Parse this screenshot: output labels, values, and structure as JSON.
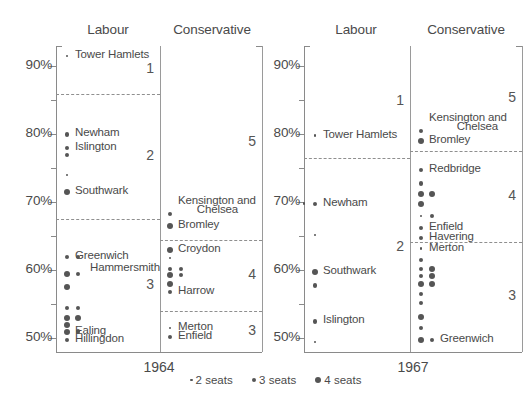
{
  "figure": {
    "panels": [
      {
        "year": "1964",
        "columns": [
          "Labour",
          "Conservative"
        ]
      },
      {
        "year": "1967",
        "columns": [
          "Labour",
          "Conservative"
        ]
      }
    ],
    "y_axis": {
      "ticks": [
        "90%",
        "80%",
        "70%",
        "60%",
        "50%"
      ],
      "minor_step": 5,
      "range": [
        48,
        93
      ]
    },
    "legend": [
      {
        "label": "2 seats",
        "size": "s2"
      },
      {
        "label": "3 seats",
        "size": "s3"
      },
      {
        "label": "4 seats",
        "size": "s4"
      }
    ]
  },
  "chart_data": {
    "type": "scatter",
    "title": "",
    "xlabel": "",
    "ylabel": "",
    "ylim": [
      48,
      93
    ],
    "y_ticks": [
      50,
      60,
      70,
      80,
      90
    ],
    "y_tick_labels": [
      "50%",
      "60%",
      "70%",
      "80%",
      "90%"
    ],
    "grid": false,
    "legend_position": "bottom",
    "size_encoding": {
      "2 seats": 2.6,
      "3 seats": 4.4,
      "4 seats": 6.2
    },
    "panels": [
      {
        "year": "1964",
        "column": "Labour",
        "bands": [
          {
            "number": "1",
            "top": 93,
            "bottom": 86
          },
          {
            "number": "2",
            "top": 86,
            "bottom": 67.5
          },
          {
            "number": "3",
            "top": 67.5,
            "bottom": 48
          }
        ],
        "points": [
          {
            "value": 91.5,
            "seats": 2,
            "label": "Tower Hamlets",
            "label_side": "right"
          },
          {
            "value": 80.0,
            "seats": 3,
            "label": "Newham",
            "label_side": "right"
          },
          {
            "value": 78.0,
            "seats": 3,
            "label": "Islington",
            "label_side": "right"
          },
          {
            "value": 77.0,
            "seats": 3,
            "label": "",
            "label_side": "right"
          },
          {
            "value": 74.0,
            "seats": 2,
            "label": "",
            "label_side": "right"
          },
          {
            "value": 71.5,
            "seats": 4,
            "label": "Southwark",
            "label_side": "right"
          },
          {
            "value": 62.0,
            "seats": 3,
            "label": "Greenwich",
            "label_side": "right"
          },
          {
            "value": 62.0,
            "seats": 3,
            "label": "Hammersmith",
            "label_side": "right",
            "offset": 1
          },
          {
            "value": 59.5,
            "seats": 4,
            "label": "",
            "label_side": "right"
          },
          {
            "value": 59.5,
            "seats": 3,
            "label": "",
            "label_side": "right",
            "offset": 1
          },
          {
            "value": 57.5,
            "seats": 4,
            "label": "",
            "label_side": "right"
          },
          {
            "value": 54.5,
            "seats": 3,
            "label": "",
            "label_side": "right"
          },
          {
            "value": 54.5,
            "seats": 3,
            "label": "",
            "label_side": "right",
            "offset": 1
          },
          {
            "value": 53.0,
            "seats": 4,
            "label": "",
            "label_side": "right"
          },
          {
            "value": 53.0,
            "seats": 4,
            "label": "",
            "label_side": "right",
            "offset": 1
          },
          {
            "value": 52.0,
            "seats": 4,
            "label": "",
            "label_side": "right"
          },
          {
            "value": 51.0,
            "seats": 4,
            "label": "Ealing",
            "label_side": "right"
          },
          {
            "value": 51.0,
            "seats": 3,
            "label": "",
            "label_side": "right",
            "offset": 1
          },
          {
            "value": 49.8,
            "seats": 3,
            "label": "Hillingdon",
            "label_side": "right"
          }
        ]
      },
      {
        "year": "1964",
        "column": "Conservative",
        "bands": [
          {
            "number": "5",
            "top": 93,
            "bottom": 64.5
          },
          {
            "number": "4",
            "top": 64.5,
            "bottom": 54.0
          },
          {
            "number": "3",
            "top": 54.0,
            "bottom": 48
          }
        ],
        "points": [
          {
            "value": 68.3,
            "seats": 3,
            "label": "Kensington and",
            "label_side": "right"
          },
          {
            "value": 68.3,
            "seats": 0,
            "label": "Chelsea",
            "label_side": "right",
            "label_align": "right"
          },
          {
            "value": 66.5,
            "seats": 4,
            "label": "Bromley",
            "label_side": "right"
          },
          {
            "value": 63.0,
            "seats": 4,
            "label": "Croydon",
            "label_side": "right"
          },
          {
            "value": 61.8,
            "seats": 2,
            "label": "",
            "label_side": "right"
          },
          {
            "value": 60.2,
            "seats": 3,
            "label": "",
            "label_side": "right"
          },
          {
            "value": 60.2,
            "seats": 3,
            "label": "",
            "label_side": "right",
            "offset": 1
          },
          {
            "value": 59.3,
            "seats": 4,
            "label": "",
            "label_side": "right"
          },
          {
            "value": 59.3,
            "seats": 3,
            "label": "",
            "label_side": "right",
            "offset": 1
          },
          {
            "value": 58.0,
            "seats": 4,
            "label": "",
            "label_side": "right"
          },
          {
            "value": 56.8,
            "seats": 3,
            "label": "Harrow",
            "label_side": "right"
          },
          {
            "value": 51.5,
            "seats": 2,
            "label": "Merton",
            "label_side": "right"
          },
          {
            "value": 50.2,
            "seats": 3,
            "label": "Enfield",
            "label_side": "right"
          }
        ]
      },
      {
        "year": "1967",
        "column": "Labour",
        "bands": [
          {
            "number": "1",
            "top": 93,
            "bottom": 76.5
          },
          {
            "number": "2",
            "top": 76.5,
            "bottom": 50.0
          }
        ],
        "points": [
          {
            "value": 79.8,
            "seats": 2,
            "label": "Tower Hamlets",
            "label_side": "right"
          },
          {
            "value": 69.8,
            "seats": 3,
            "label": "Newham",
            "label_side": "right"
          },
          {
            "value": 69.8,
            "seats": 2,
            "label": "",
            "label_side": "left",
            "offset": -1
          },
          {
            "value": 65.2,
            "seats": 2,
            "label": "",
            "label_side": "right"
          },
          {
            "value": 59.8,
            "seats": 4,
            "label": "Southwark",
            "label_side": "right"
          },
          {
            "value": 57.8,
            "seats": 3,
            "label": "",
            "label_side": "right"
          },
          {
            "value": 52.5,
            "seats": 3,
            "label": "Islington",
            "label_side": "right"
          },
          {
            "value": 49.5,
            "seats": 2,
            "label": "",
            "label_side": "right"
          }
        ]
      },
      {
        "year": "1967",
        "column": "Conservative",
        "bands": [
          {
            "number": "5",
            "top": 93,
            "bottom": 77.5
          },
          {
            "number": "4",
            "top": 77.5,
            "bottom": 64.2
          },
          {
            "number": "3",
            "top": 64.2,
            "bottom": 48
          }
        ],
        "points": [
          {
            "value": 80.5,
            "seats": 3,
            "label": "Kensington and",
            "label_side": "right"
          },
          {
            "value": 80.5,
            "seats": 0,
            "label": "Chelsea",
            "label_side": "right",
            "label_align": "right"
          },
          {
            "value": 79.0,
            "seats": 4,
            "label": "Bromley",
            "label_side": "right"
          },
          {
            "value": 74.8,
            "seats": 3,
            "label": "Redbridge",
            "label_side": "right"
          },
          {
            "value": 72.8,
            "seats": 3,
            "label": "",
            "label_side": "right"
          },
          {
            "value": 71.2,
            "seats": 4,
            "label": "",
            "label_side": "right"
          },
          {
            "value": 71.2,
            "seats": 4,
            "label": "",
            "label_side": "right",
            "offset": 1
          },
          {
            "value": 69.8,
            "seats": 4,
            "label": "",
            "label_side": "right"
          },
          {
            "value": 68.0,
            "seats": 2,
            "label": "",
            "label_side": "right"
          },
          {
            "value": 68.0,
            "seats": 3,
            "label": "",
            "label_side": "right",
            "offset": 1
          },
          {
            "value": 66.2,
            "seats": 3,
            "label": "Enfield",
            "label_side": "right"
          },
          {
            "value": 64.8,
            "seats": 3,
            "label": "Havering",
            "label_side": "right"
          },
          {
            "value": 63.2,
            "seats": 2,
            "label": "Merton",
            "label_side": "right"
          },
          {
            "value": 61.5,
            "seats": 3,
            "label": "",
            "label_side": "right"
          },
          {
            "value": 60.2,
            "seats": 3,
            "label": "",
            "label_side": "right"
          },
          {
            "value": 60.2,
            "seats": 4,
            "label": "",
            "label_side": "right",
            "offset": 1
          },
          {
            "value": 59.2,
            "seats": 3,
            "label": "",
            "label_side": "right"
          },
          {
            "value": 59.2,
            "seats": 4,
            "label": "",
            "label_side": "right",
            "offset": 1
          },
          {
            "value": 58.0,
            "seats": 4,
            "label": "",
            "label_side": "right"
          },
          {
            "value": 58.0,
            "seats": 4,
            "label": "",
            "label_side": "right",
            "offset": 1
          },
          {
            "value": 56.5,
            "seats": 3,
            "label": "",
            "label_side": "right"
          },
          {
            "value": 55.2,
            "seats": 3,
            "label": "",
            "label_side": "right"
          },
          {
            "value": 53.2,
            "seats": 4,
            "label": "",
            "label_side": "right"
          },
          {
            "value": 51.5,
            "seats": 3,
            "label": "",
            "label_side": "right"
          },
          {
            "value": 49.8,
            "seats": 4,
            "label": "",
            "label_side": "right"
          },
          {
            "value": 49.8,
            "seats": 3,
            "label": "Greenwich",
            "label_side": "right",
            "offset": 1
          }
        ]
      }
    ]
  }
}
